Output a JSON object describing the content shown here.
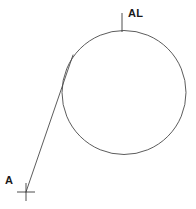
{
  "diagram": {
    "background_color": "#ffffff",
    "stroke_color": "#4a4a4a",
    "marker_color": "#3a3a3a",
    "text_color": "#1a1a1a",
    "stroke_width": 0.9,
    "canvas": {
      "width": 196,
      "height": 209
    },
    "labels": {
      "tangent_point_label": "AL",
      "external_point_label": "A"
    },
    "shapes": {
      "circle": {
        "name": "circle",
        "center_x": 124,
        "center_y": 92.5,
        "radius": 62,
        "filled": false
      },
      "tangent_line": {
        "name": "tangent-line",
        "x1": 26,
        "y1": 192,
        "x2": 73,
        "y2": 55
      },
      "top_tick": {
        "name": "top-tick-mark",
        "x1": 122,
        "y1": 13,
        "x2": 122,
        "y2": 32
      },
      "point_a_cross": {
        "name": "point-a-cross",
        "center_x": 26,
        "center_y": 192,
        "arm_length": 9
      }
    }
  }
}
